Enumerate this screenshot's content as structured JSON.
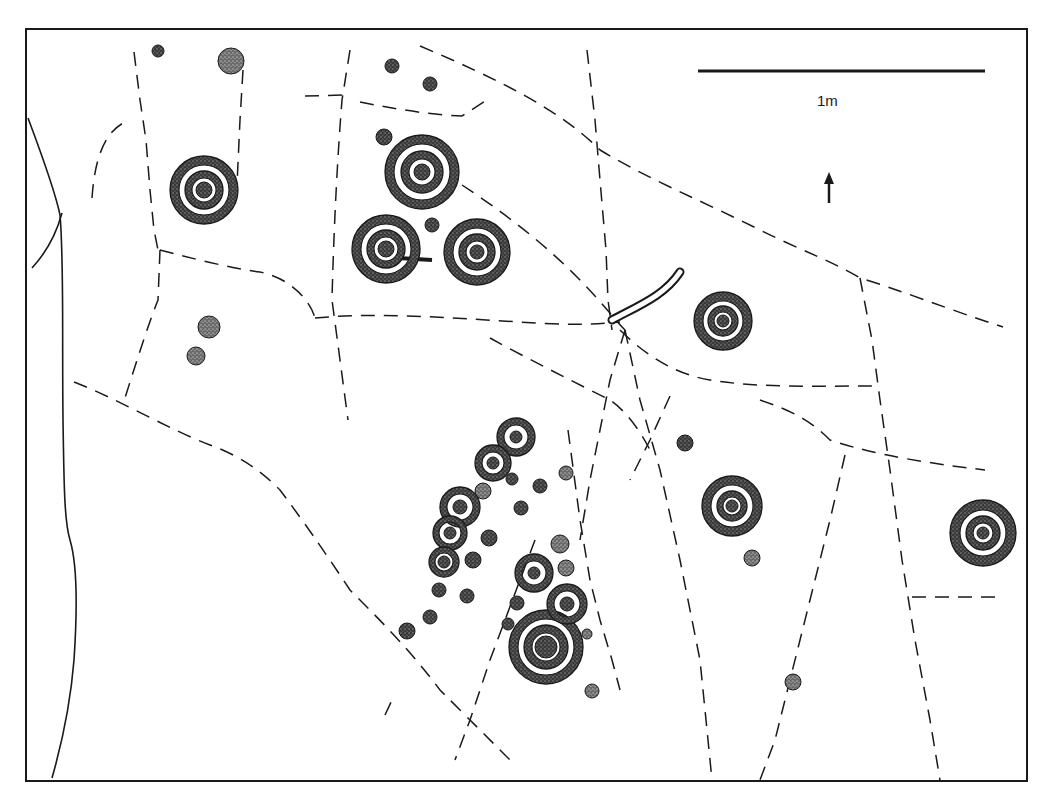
{
  "figure": {
    "kind": "rock-art panel survey drawing",
    "scale_bar": {
      "label": "1m",
      "length_m": 1
    },
    "north_arrow": {
      "symbol": "arrow-up",
      "meaning": "north"
    }
  },
  "legend_implicit": {
    "cup": "solid stippled dot",
    "cup_and_ring": "stippled dot with concentric stippled rings",
    "groove": "open curved channel",
    "crack": "dashed line (fissure in rock surface)",
    "panel_edge": "solid irregular line"
  },
  "features": {
    "cup_and_ring_marks": [
      {
        "id": "cr1",
        "rings": 2
      },
      {
        "id": "cr2",
        "rings": 2
      },
      {
        "id": "cr3",
        "rings": 2,
        "note": "tail/groove to right"
      },
      {
        "id": "cr4",
        "rings": 2
      },
      {
        "id": "cr5",
        "rings": 2
      },
      {
        "id": "cr6",
        "rings": 2
      },
      {
        "id": "cr7",
        "rings": 2
      },
      {
        "id": "cr8",
        "rings": 1
      },
      {
        "id": "cr9",
        "rings": 2
      },
      {
        "id": "chain-1",
        "rings": 1
      },
      {
        "id": "chain-2",
        "rings": 1
      },
      {
        "id": "chain-3",
        "rings": 1
      },
      {
        "id": "chain-4",
        "rings": 1
      },
      {
        "id": "chain-5",
        "rings": 1
      },
      {
        "id": "cr-small-a",
        "rings": 1
      },
      {
        "id": "cr-small-b",
        "rings": 1
      }
    ],
    "groove_count": 1
  },
  "colors": {
    "ink": "#1a1a1a",
    "stipple": "#5a5a5a",
    "paper": "#ffffff"
  }
}
